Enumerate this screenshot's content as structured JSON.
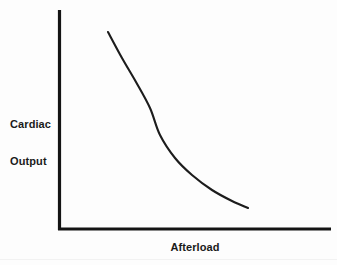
{
  "figure": {
    "background_color": "#fdfdfd",
    "ink_color": "#1a1a1a",
    "width": 337,
    "height": 265
  },
  "axes": {
    "y_axis_label_line1": "Cardiac",
    "y_axis_label_line2": "Output",
    "x_axis_label": "Afterload",
    "y_axis_name": "y-axis-spine",
    "x_axis_name": "x-axis-spine"
  },
  "chart_data": {
    "type": "line",
    "title": "",
    "subtitle": "",
    "xlabel": "Afterload",
    "ylabel": "Cardiac Output",
    "grid": false,
    "legend": false,
    "legend_position": "none",
    "x_tick_labels": [],
    "y_tick_labels": [],
    "xlim": [
      0,
      1
    ],
    "ylim": [
      0,
      1
    ],
    "annotations": [],
    "series": [
      {
        "name": "Cardiac output vs afterload",
        "color": "#1c1c1c",
        "line_width": 2.1,
        "marker": "none",
        "x": [
          0.18,
          0.23,
          0.28,
          0.33,
          0.372,
          0.42,
          0.47,
          0.52,
          0.57,
          0.62,
          0.67,
          0.696
        ],
        "y": [
          0.9,
          0.8,
          0.7,
          0.61,
          0.545,
          0.48,
          0.42,
          0.365,
          0.315,
          0.265,
          0.218,
          0.196
        ]
      }
    ],
    "pixel_path": {
      "comment": "Curve control points in screenshot pixel coordinates (337x265 frame).",
      "start": [
        108,
        32
      ],
      "end": [
        248,
        208
      ],
      "points": [
        [
          108,
          32
        ],
        [
          122,
          58
        ],
        [
          136,
          82
        ],
        [
          150,
          108
        ],
        [
          160,
          135
        ],
        [
          175,
          158
        ],
        [
          192,
          175
        ],
        [
          212,
          190
        ],
        [
          232,
          201
        ],
        [
          248,
          208
        ]
      ]
    },
    "pixel_axes": {
      "y_axis_x": 59.5,
      "y_axis_top": 10,
      "y_axis_bottom": 230,
      "x_axis_y": 229,
      "x_axis_left": 58,
      "x_axis_right": 331
    }
  }
}
